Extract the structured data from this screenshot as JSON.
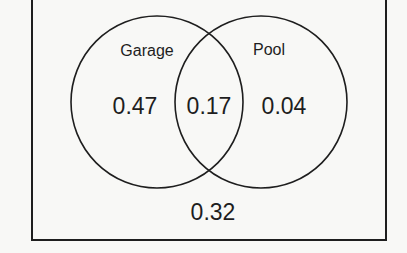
{
  "diagram": {
    "type": "venn",
    "universe": {
      "outside_value": "0.32"
    },
    "sets": [
      {
        "name": "Garage",
        "only_value": "0.47"
      },
      {
        "name": "Pool",
        "only_value": "0.04"
      }
    ],
    "intersection_value": "0.17"
  },
  "colors": {
    "stroke": "#1e1e1e",
    "background": "#f8f8f6"
  }
}
